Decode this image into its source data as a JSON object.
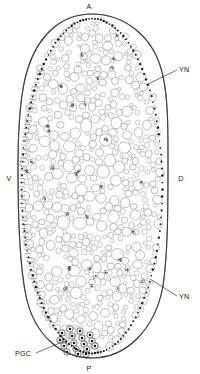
{
  "figure": {
    "canvas": {
      "width": 200,
      "height": 374
    },
    "background_color": "#ffffff",
    "ink_color": "#2b2b2b"
  },
  "labels": [
    {
      "id": "anterior",
      "text": "A",
      "x": 89,
      "y": 9,
      "anchor": "middle",
      "leader": false
    },
    {
      "id": "posterior",
      "text": "P",
      "x": 89,
      "y": 371,
      "anchor": "middle",
      "leader": false
    },
    {
      "id": "ventral",
      "text": "V",
      "x": 9,
      "y": 181,
      "anchor": "middle",
      "leader": false
    },
    {
      "id": "dorsal",
      "text": "D",
      "x": 181,
      "y": 181,
      "anchor": "middle",
      "leader": false
    },
    {
      "id": "yolk-nuclei-upper",
      "text": "YN",
      "x": 179,
      "y": 72,
      "anchor": "start",
      "leader": true,
      "leader_path": "M177,70 L146,85"
    },
    {
      "id": "yolk-nuclei-lower",
      "text": "YN",
      "x": 179,
      "y": 299,
      "anchor": "start",
      "leader": true,
      "leader_path": "M177,296 L150,279"
    },
    {
      "id": "primordial-germ-cells",
      "text": "PGC",
      "x": 15,
      "y": 356,
      "anchor": "start",
      "leader": true,
      "leader_path": "M36,353 L67,340"
    }
  ],
  "legend_keys": [
    {
      "abbr": "A",
      "meaning": "Anterior pole"
    },
    {
      "abbr": "P",
      "meaning": "Posterior pole"
    },
    {
      "abbr": "V",
      "meaning": "Ventral side"
    },
    {
      "abbr": "D",
      "meaning": "Dorsal side"
    },
    {
      "abbr": "YN",
      "meaning": "Yolk nuclei"
    },
    {
      "abbr": "PGC",
      "meaning": "Primordial germ cells"
    }
  ],
  "structures": {
    "egg_outline": {
      "name": "egg-outline",
      "shape": "ovoid",
      "cx": 92,
      "cy": 186,
      "rx": 75,
      "ry": 172,
      "path": "M92,14 C124,14 153,36 162,72 C168,96 168,124 168,160 C168,206 168,252 163,286 C155,330 126,358 92,358 C60,358 34,334 26,296 C19,262 18,216 18,168 C18,126 20,92 28,68 C39,34 62,14 92,14 Z"
    },
    "vitelline_membrane": {
      "name": "vitelline-membrane",
      "inset": 3.5,
      "stroke": "#444444"
    },
    "periplasm_nuclei": {
      "name": "peripheral-nuclei",
      "description": "dark dots distributed along the inner face of the egg membrane",
      "count": 150,
      "color": "#141414",
      "dot_radius": 1.05
    },
    "striated_cortex": {
      "name": "striated-cortex",
      "description": "ladder-like radial striations along the ventral (left) margin",
      "side": "ventral",
      "from_y": 70,
      "to_y": 320,
      "stripe_count": 60,
      "color": "#3a3a3a"
    },
    "yolk_granules": {
      "name": "yolk-granules",
      "description": "densely packed pale circles filling the egg interior",
      "count": 560,
      "radius_min": 1.6,
      "radius_max": 7.2,
      "fill": "#fdfdfd",
      "stroke": "#6e6e6e"
    },
    "yolk_nuclei": {
      "name": "yolk-nuclei",
      "description": "small stippled grey clusters scattered among the yolk granules",
      "count": 34,
      "color": "#8d8d8d",
      "radius": 2.1
    },
    "germ_cell_cluster": {
      "name": "primordial-germ-cell-cluster",
      "description": "group of rounded cells with dark nuclei at the posterior pole",
      "cell_count": 17,
      "cx": 74,
      "cy": 338,
      "cell_radius": 3.2,
      "nucleus_radius": 1.25,
      "cell_fill": "#fafafa",
      "nucleus_fill": "#111111"
    }
  }
}
